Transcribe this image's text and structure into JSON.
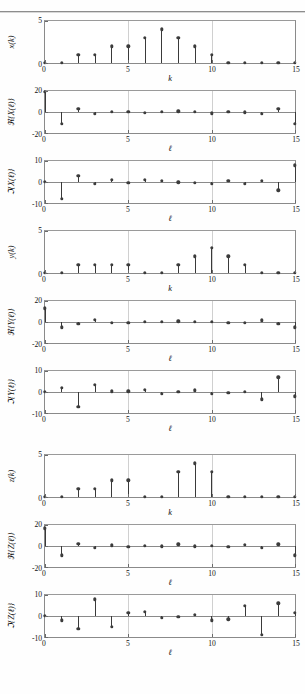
{
  "page": {
    "page_number": "",
    "figure_caption": ""
  },
  "chart_data": [
    {
      "type": "line",
      "plot_style": "stem",
      "title": "",
      "xlabel": "k",
      "ylabel": "x(k)",
      "ylabel_parts": {
        "prefix": "",
        "symbol": "x",
        "arg": "(k)"
      },
      "x": [
        0,
        1,
        2,
        3,
        4,
        5,
        6,
        7,
        8,
        9,
        10,
        11,
        12,
        13,
        14,
        15
      ],
      "values": [
        0,
        0,
        1,
        1,
        2,
        2,
        3,
        4,
        3,
        2,
        1,
        0,
        0,
        0,
        0,
        0
      ],
      "xlim": [
        0,
        15
      ],
      "ylim": [
        0,
        5
      ],
      "yticks": [
        0,
        5
      ],
      "ytick_labels": [
        "0",
        "5"
      ],
      "xticks": [
        0,
        5,
        10,
        15
      ],
      "xtick_labels": [
        "0",
        "5",
        "10",
        "15"
      ],
      "grid": true
    },
    {
      "type": "line",
      "plot_style": "stem",
      "title": "",
      "xlabel": "ℓ",
      "ylabel": "ℜ{X(ℓ)}",
      "ylabel_parts": {
        "prefix": "ℜ{",
        "symbol": "X",
        "arg": "(ℓ)}"
      },
      "x": [
        0,
        1,
        2,
        3,
        4,
        5,
        6,
        7,
        8,
        9,
        10,
        11,
        12,
        13,
        14,
        15
      ],
      "values": [
        19,
        -11,
        3,
        -2,
        0.3,
        0.2,
        -1,
        0.4,
        0.8,
        0.3,
        -1.2,
        0.2,
        -0.3,
        -2,
        3,
        -11
      ],
      "xlim": [
        0,
        15
      ],
      "ylim": [
        -20,
        20
      ],
      "yticks": [
        -20,
        0,
        20
      ],
      "ytick_labels": [
        "-20",
        "0",
        "20"
      ],
      "xticks": [
        0,
        5,
        10,
        15
      ],
      "xtick_labels": [
        "0",
        "5",
        "10",
        "15"
      ],
      "grid": true
    },
    {
      "type": "line",
      "plot_style": "stem",
      "title": "",
      "xlabel": "ℓ",
      "ylabel": "ℑ{X(ℓ)}",
      "ylabel_parts": {
        "prefix": "ℑ{",
        "symbol": "X",
        "arg": "(ℓ)}"
      },
      "x": [
        0,
        1,
        2,
        3,
        4,
        5,
        6,
        7,
        8,
        9,
        10,
        11,
        12,
        13,
        14,
        15
      ],
      "values": [
        0,
        -8,
        3,
        -0.8,
        1,
        -0.5,
        1.1,
        0.5,
        -0.2,
        -0.4,
        -0.9,
        0.5,
        -0.8,
        0.5,
        -4,
        8
      ],
      "xlim": [
        0,
        15
      ],
      "ylim": [
        -10,
        10
      ],
      "yticks": [
        -10,
        0,
        10
      ],
      "ytick_labels": [
        "-10",
        "0",
        "10"
      ],
      "xticks": [
        0,
        5,
        10,
        15
      ],
      "xtick_labels": [
        "0",
        "5",
        "10",
        "15"
      ],
      "grid": true
    },
    {
      "type": "line",
      "plot_style": "stem",
      "title": "",
      "xlabel": "k",
      "ylabel": "y(k)",
      "ylabel_parts": {
        "prefix": "",
        "symbol": "y",
        "arg": "(k)"
      },
      "x": [
        0,
        1,
        2,
        3,
        4,
        5,
        6,
        7,
        8,
        9,
        10,
        11,
        12,
        13,
        14,
        15
      ],
      "values": [
        0,
        0,
        1,
        1,
        1,
        1,
        0,
        0,
        1,
        2,
        3,
        2,
        1,
        0,
        0,
        0
      ],
      "xlim": [
        0,
        15
      ],
      "ylim": [
        0,
        5
      ],
      "yticks": [
        0,
        5
      ],
      "ytick_labels": [
        "0",
        "5"
      ],
      "xticks": [
        0,
        5,
        10,
        15
      ],
      "xtick_labels": [
        "0",
        "5",
        "10",
        "15"
      ],
      "grid": true
    },
    {
      "type": "line",
      "plot_style": "stem",
      "title": "",
      "xlabel": "ℓ",
      "ylabel": "ℜ{Y(ℓ)}",
      "ylabel_parts": {
        "prefix": "ℜ{",
        "symbol": "Y",
        "arg": "(ℓ)}"
      },
      "x": [
        0,
        1,
        2,
        3,
        4,
        5,
        6,
        7,
        8,
        9,
        10,
        11,
        12,
        13,
        14,
        15
      ],
      "values": [
        13,
        -5,
        -2,
        2,
        -0.8,
        -0.5,
        0.4,
        0.3,
        0.8,
        0.3,
        0.3,
        -0.8,
        -0.5,
        1.5,
        -2,
        -5
      ],
      "xlim": [
        0,
        15
      ],
      "ylim": [
        -20,
        20
      ],
      "yticks": [
        -20,
        0,
        20
      ],
      "ytick_labels": [
        "-20",
        "0",
        "20"
      ],
      "xticks": [
        0,
        5,
        10,
        15
      ],
      "xtick_labels": [
        "0",
        "5",
        "10",
        "15"
      ],
      "grid": true
    },
    {
      "type": "line",
      "plot_style": "stem",
      "title": "",
      "xlabel": "ℓ",
      "ylabel": "ℑ{Y(ℓ)}",
      "ylabel_parts": {
        "prefix": "ℑ{",
        "symbol": "Y",
        "arg": "(ℓ)}"
      },
      "x": [
        0,
        1,
        2,
        3,
        4,
        5,
        6,
        7,
        8,
        9,
        10,
        11,
        12,
        13,
        14,
        15
      ],
      "values": [
        0,
        2,
        -7,
        3.5,
        0.3,
        0.3,
        1,
        -0.8,
        0.2,
        0.8,
        -1,
        -0.4,
        0.2,
        -3.5,
        7,
        -2
      ],
      "xlim": [
        0,
        15
      ],
      "ylim": [
        -10,
        10
      ],
      "yticks": [
        -10,
        0,
        10
      ],
      "ytick_labels": [
        "-10",
        "0",
        "10"
      ],
      "xticks": [
        0,
        5,
        10,
        15
      ],
      "xtick_labels": [
        "0",
        "5",
        "10",
        "15"
      ],
      "grid": true
    },
    {
      "type": "line",
      "plot_style": "stem",
      "title": "",
      "xlabel": "k",
      "ylabel": "z(k)",
      "ylabel_parts": {
        "prefix": "",
        "symbol": "z",
        "arg": "(k)"
      },
      "x": [
        0,
        1,
        2,
        3,
        4,
        5,
        6,
        7,
        8,
        9,
        10,
        11,
        12,
        13,
        14,
        15
      ],
      "values": [
        0,
        0,
        1,
        1,
        2,
        2,
        0,
        0,
        3,
        4,
        3,
        0,
        0,
        0,
        0,
        0
      ],
      "xlim": [
        0,
        15
      ],
      "ylim": [
        0,
        5
      ],
      "yticks": [
        0,
        5
      ],
      "ytick_labels": [
        "0",
        "5"
      ],
      "xticks": [
        0,
        5,
        10,
        15
      ],
      "xtick_labels": [
        "0",
        "5",
        "10",
        "15"
      ],
      "grid": true
    },
    {
      "type": "line",
      "plot_style": "stem",
      "title": "",
      "xlabel": "ℓ",
      "ylabel": "ℜ{Z(ℓ)}",
      "ylabel_parts": {
        "prefix": "ℜ{",
        "symbol": "Z",
        "arg": "(ℓ)}"
      },
      "x": [
        0,
        1,
        2,
        3,
        4,
        5,
        6,
        7,
        8,
        9,
        10,
        11,
        12,
        13,
        14,
        15
      ],
      "values": [
        17,
        -9,
        2,
        -2,
        0.8,
        -0.8,
        0.3,
        -0.3,
        1.5,
        -0.4,
        0.3,
        -0.8,
        1,
        -2,
        1.5,
        -9
      ],
      "xlim": [
        0,
        15
      ],
      "ylim": [
        -20,
        20
      ],
      "yticks": [
        -20,
        0,
        20
      ],
      "ytick_labels": [
        "-20",
        "0",
        "20"
      ],
      "xticks": [
        0,
        5,
        10,
        15
      ],
      "xtick_labels": [
        "0",
        "5",
        "10",
        "15"
      ],
      "grid": true
    },
    {
      "type": "line",
      "plot_style": "stem",
      "title": "",
      "xlabel": "ℓ",
      "ylabel": "ℑ{Z(ℓ)}",
      "ylabel_parts": {
        "prefix": "ℑ{",
        "symbol": "Z",
        "arg": "(ℓ)}"
      },
      "x": [
        0,
        1,
        2,
        3,
        4,
        5,
        6,
        7,
        8,
        9,
        10,
        11,
        12,
        13,
        14,
        15
      ],
      "values": [
        0,
        -2,
        -6,
        8,
        -5,
        1.5,
        2,
        -1,
        -0.3,
        0.5,
        -2,
        -1.5,
        5,
        -9,
        6,
        1.5
      ],
      "xlim": [
        0,
        15
      ],
      "ylim": [
        -10,
        10
      ],
      "yticks": [
        -10,
        0,
        10
      ],
      "ytick_labels": [
        "-10",
        "0",
        "10"
      ],
      "xticks": [
        0,
        5,
        10,
        15
      ],
      "xtick_labels": [
        "0",
        "5",
        "10",
        "15"
      ],
      "grid": true
    }
  ],
  "style": {
    "marker_color": "#3c3c3c",
    "stem_color": "#3a3a3a",
    "axis_color": "#8a8a8a",
    "grid_color": "#d0d0d0",
    "background": "#ffffff"
  }
}
